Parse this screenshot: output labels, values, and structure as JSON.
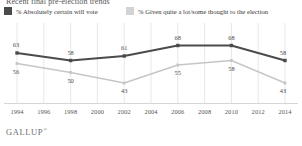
{
  "header": {
    "title": "Recent final pre-election trends"
  },
  "legend": {
    "position": "top",
    "items": [
      {
        "label": "% Absolutely certain will vote",
        "color": "#4b4b4b",
        "icon": "legend-swatch"
      },
      {
        "label": "% Given quite a lot/some thought to the election",
        "color": "#d3d3d3",
        "icon": "legend-swatch"
      }
    ]
  },
  "footer": {
    "brand": "GALLUP",
    "mark": "®"
  },
  "chart_data": {
    "type": "line",
    "title": "Recent final pre-election trends",
    "xlabel": "",
    "ylabel": "",
    "grid": "vertical",
    "ylim": [
      35,
      75
    ],
    "axis_ticks": [
      "1994",
      "1996",
      "1998",
      "2000",
      "2002",
      "2004",
      "2006",
      "2008",
      "2010",
      "2012",
      "2014"
    ],
    "x": [
      1994,
      1998,
      2002,
      2006,
      2010,
      2014
    ],
    "categories": [
      "1994",
      "1998",
      "2002",
      "2006",
      "2010",
      "2014"
    ],
    "series": [
      {
        "name": "% Absolutely certain will vote",
        "color": "#4b4b4b",
        "values": [
          63,
          58,
          61,
          68,
          68,
          58
        ]
      },
      {
        "name": "% Given quite a lot/some thought to the election",
        "color": "#c6c6c6",
        "values": [
          56,
          50,
          43,
          55,
          58,
          43
        ]
      }
    ]
  }
}
